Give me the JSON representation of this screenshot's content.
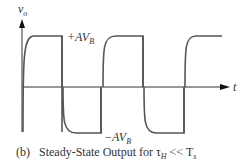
{
  "figure": {
    "y_axis_label": "v",
    "y_axis_label_sub": "o",
    "x_axis_label": "t",
    "high_level_label": "+AV",
    "high_level_sub": "B",
    "low_level_label": "−AV",
    "low_level_sub": "B",
    "caption_prefix": "(b)",
    "caption_text": "Steady-State Output for τ",
    "caption_sub": "H",
    "caption_suffix": " << T",
    "caption_suffix_sub": "s",
    "line_color": "#555555"
  }
}
